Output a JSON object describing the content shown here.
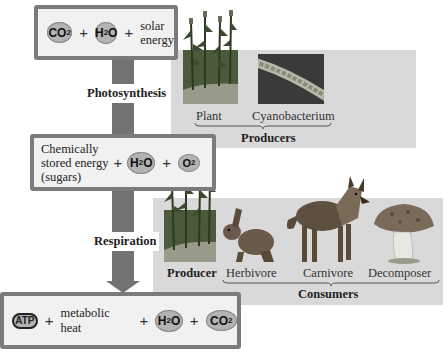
{
  "top_box": {
    "molecules": [
      "CO",
      "H",
      "O"
    ],
    "co2": {
      "base": "CO",
      "sub": "2"
    },
    "h2o": {
      "pre": "H",
      "sub": "2",
      "post": "O"
    },
    "text_line1": "solar",
    "text_line2": "energy",
    "plus": "+"
  },
  "arrow1": {
    "label": "Photosynthesis"
  },
  "middle_box": {
    "line1": "Chemically",
    "line2": "stored energy",
    "line3": "(sugars)",
    "h2o": {
      "pre": "H",
      "sub": "2",
      "post": "O"
    },
    "o2": {
      "base": "O",
      "sub": "2"
    },
    "plus": "+"
  },
  "arrow2": {
    "label": "Respiration"
  },
  "bottom_box": {
    "atp": "ATP",
    "heat": "metabolic heat",
    "h2o": {
      "pre": "H",
      "sub": "2",
      "post": "O"
    },
    "co2": {
      "base": "CO",
      "sub": "2"
    },
    "plus": "+"
  },
  "producers_panel": {
    "items": [
      {
        "label": "Plant"
      },
      {
        "label": "Cyanobacterium"
      }
    ],
    "group_label": "Producers"
  },
  "consumers_panel": {
    "producer_label": "Producer",
    "items": [
      {
        "label": "Herbivore"
      },
      {
        "label": "Carnivore"
      },
      {
        "label": "Decomposer"
      }
    ],
    "group_label": "Consumers"
  },
  "colors": {
    "box_border": "#7b7b7b",
    "box_fill": "#f1f1f1",
    "arrow": "#737373",
    "molecule": "#b3b3b3",
    "panel": "#d9d9d9"
  }
}
